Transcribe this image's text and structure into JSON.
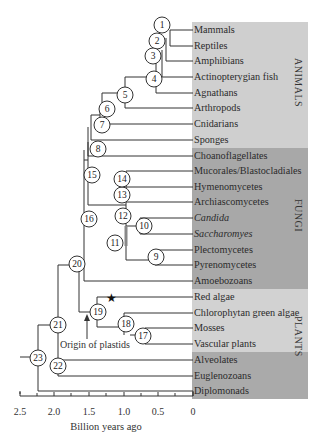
{
  "figure": {
    "groups": [
      {
        "name": "ANIMALS",
        "color": "#c8c8c8"
      },
      {
        "name": "FUNGI",
        "color": "#a9a9a9"
      },
      {
        "name": "PLANTS",
        "color": "#d0d0d0"
      },
      {
        "name": "other",
        "color": "#a9a9a9"
      }
    ],
    "leaves": [
      {
        "label": "Mammals",
        "group": "ANIMALS"
      },
      {
        "label": "Reptiles",
        "group": "ANIMALS"
      },
      {
        "label": "Amphibians",
        "group": "ANIMALS"
      },
      {
        "label": "Actinopterygian fish",
        "group": "ANIMALS"
      },
      {
        "label": "Agnathans",
        "group": "ANIMALS"
      },
      {
        "label": "Arthropods",
        "group": "ANIMALS"
      },
      {
        "label": "Cnidarians",
        "group": "ANIMALS"
      },
      {
        "label": "Sponges",
        "group": "ANIMALS"
      },
      {
        "label": "Choanoflagellates",
        "group": "FUNGI"
      },
      {
        "label": "Mucorales/Blastocladiales",
        "group": "FUNGI"
      },
      {
        "label": "Hymenomycetes",
        "group": "FUNGI"
      },
      {
        "label": "Archiascomycetes",
        "group": "FUNGI"
      },
      {
        "label": "Candida",
        "group": "FUNGI",
        "italic": true
      },
      {
        "label": "Saccharomyes",
        "group": "FUNGI",
        "italic": true
      },
      {
        "label": "Plectomycetes",
        "group": "FUNGI"
      },
      {
        "label": "Pyrenomycetes",
        "group": "FUNGI"
      },
      {
        "label": "Amoebozoans",
        "group": "FUNGI"
      },
      {
        "label": "Red algae",
        "group": "PLANTS"
      },
      {
        "label": "Chlorophytan green algae",
        "group": "PLANTS"
      },
      {
        "label": "Mosses",
        "group": "PLANTS"
      },
      {
        "label": "Vascular plants",
        "group": "PLANTS"
      },
      {
        "label": "Alveolates",
        "group": "other"
      },
      {
        "label": "Euglenozoans",
        "group": "other"
      },
      {
        "label": "Diplomonads",
        "group": "other"
      }
    ],
    "group_labels": {
      "animals": "ANIMALS",
      "fungi": "FUNGI",
      "plants": "PLANTS"
    },
    "nodes": [
      "1",
      "2",
      "3",
      "4",
      "5",
      "6",
      "7",
      "8",
      "9",
      "10",
      "11",
      "12",
      "13",
      "14",
      "15",
      "16",
      "17",
      "18",
      "19",
      "20",
      "21",
      "22",
      "23"
    ],
    "annotations": {
      "origin_of_plastids": "Origin of plastids",
      "star_marker": "★"
    },
    "axis": {
      "title": "Billion years ago",
      "ticks": [
        "2.5",
        "2.0",
        "1.5",
        "1.0",
        "0.5",
        "0"
      ]
    }
  }
}
